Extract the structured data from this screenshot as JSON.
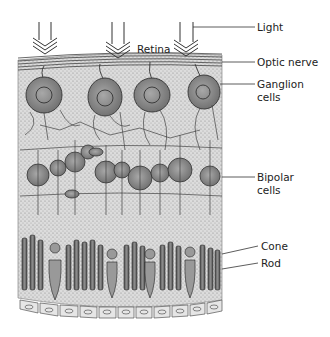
{
  "labels": {
    "light": "Light",
    "retina": "Retina",
    "optic_nerve": "Optic nerve",
    "ganglion_1": "Ganglion",
    "ganglion_2": "cells",
    "bipolar_1": "Bipolar",
    "bipolar_2": "cells",
    "cone": "Cone",
    "rod": "Rod"
  },
  "colors": {
    "ink": "#333333",
    "cell_fill": "#8a8a8a",
    "tissue_fill": "#d4d4d4",
    "epithelium_fill": "#e6e6e6"
  },
  "arrows": [
    {
      "x": 44
    },
    {
      "x": 120
    },
    {
      "x": 188
    }
  ]
}
